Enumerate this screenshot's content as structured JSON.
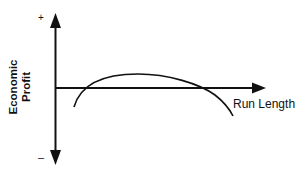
{
  "diagram": {
    "y_axis": {
      "label_line1": "Economic",
      "label_line2": "Profit",
      "top_sign": "+",
      "bottom_sign": "–"
    },
    "x_axis": {
      "label": "Run Length"
    },
    "curve": {
      "description": "Inverted-U economic profit curve vs run length, positive between two crossings of the horizontal axis"
    },
    "colors": {
      "stroke": "#111111",
      "background": "#ffffff"
    }
  }
}
